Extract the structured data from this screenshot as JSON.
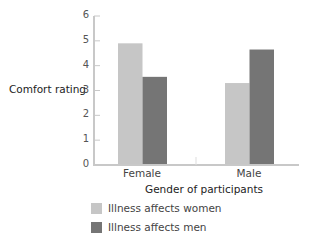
{
  "chart_data": {
    "type": "bar",
    "title": "",
    "xlabel": "Gender of participants",
    "ylabel": "Comfort rating",
    "ylim": [
      0,
      6
    ],
    "yticks": [
      0,
      1,
      2,
      3,
      4,
      5,
      6
    ],
    "grid": false,
    "legend_position": "bottom-left",
    "categories": [
      "Female",
      "Male"
    ],
    "series": [
      {
        "name": "Illness affects women",
        "color": "#c6c6c6",
        "values": [
          4.9,
          3.3
        ]
      },
      {
        "name": "Illness affects men",
        "color": "#757575",
        "values": [
          3.55,
          4.65
        ]
      }
    ]
  },
  "labels": {
    "ylabel": "Comfort rating",
    "xlabel": "Gender of participants",
    "categories": [
      "Female",
      "Male"
    ],
    "yticks": [
      "0",
      "1",
      "2",
      "3",
      "4",
      "5",
      "6"
    ],
    "legend": [
      "Illness affects women",
      "Illness affects men"
    ]
  },
  "colors": {
    "women": "#c6c6c6",
    "men": "#757575",
    "axis": "#c8c8c8"
  }
}
